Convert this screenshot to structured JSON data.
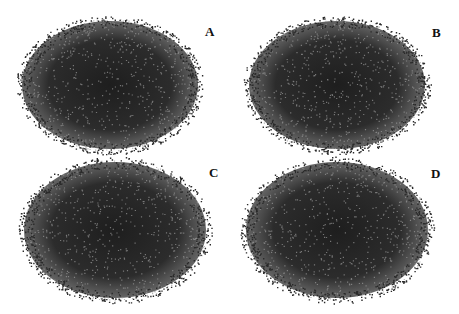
{
  "figure": {
    "background": "#ffffff",
    "node_color": "#2a2a2a",
    "edge_color": "#5a5a5a",
    "panels": [
      {
        "id": "A",
        "label": "A",
        "cx": 110,
        "cy": 85,
        "rx": 92,
        "ry": 68,
        "label_x": 205,
        "label_y": 24
      },
      {
        "id": "B",
        "label": "B",
        "cx": 337,
        "cy": 85,
        "rx": 92,
        "ry": 68,
        "label_x": 432,
        "label_y": 25
      },
      {
        "id": "C",
        "label": "C",
        "cx": 115,
        "cy": 230,
        "rx": 95,
        "ry": 72,
        "label_x": 209,
        "label_y": 165
      },
      {
        "id": "D",
        "label": "D",
        "cx": 337,
        "cy": 230,
        "rx": 95,
        "ry": 72,
        "label_x": 431,
        "label_y": 166
      }
    ]
  }
}
